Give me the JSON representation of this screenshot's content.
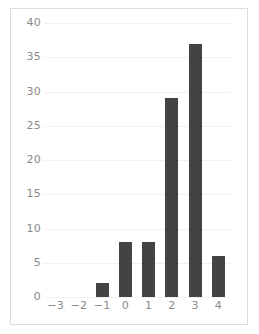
{
  "chart_data": {
    "type": "bar",
    "title": "",
    "subtitle": "",
    "xlabel": "",
    "ylabel": "",
    "categories": [
      "−3",
      "−2",
      "−1",
      "0",
      "1",
      "2",
      "3",
      "4"
    ],
    "values": [
      0,
      0,
      2,
      8,
      8,
      29,
      37,
      6
    ],
    "xlim": [
      -3.6,
      4.6
    ],
    "ylim": [
      0,
      40
    ],
    "yticks": [
      0,
      5,
      10,
      15,
      20,
      25,
      30,
      35,
      40
    ],
    "ytick_labels": [
      "0",
      "5",
      "10",
      "15",
      "20",
      "25",
      "30",
      "35",
      "40"
    ],
    "xticks": [
      -3,
      -2,
      -1,
      0,
      1,
      2,
      3,
      4
    ],
    "xtick_labels": [
      "−3",
      "−2",
      "−1",
      "0",
      "1",
      "2",
      "3",
      "4"
    ],
    "grid": true,
    "grid_axis": "y",
    "legend": false,
    "legend_position": "none",
    "annotations": []
  },
  "style": {
    "bar_color": "#434343",
    "grid_color": "#f0f0f0",
    "tick_label_color": "#8a8a8a",
    "frame_color": "#dcdcdc",
    "background_color": "#ffffff"
  }
}
